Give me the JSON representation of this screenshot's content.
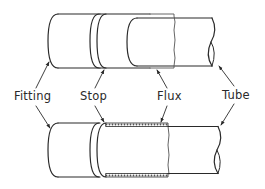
{
  "diagram": {
    "type": "technical-illustration",
    "stroke_color": "#2a2a2a",
    "background_color": "#ffffff",
    "labels": {
      "fitting": "Fitting",
      "stop": "Stop",
      "flux": "Flux",
      "tube": "Tube"
    },
    "views": [
      {
        "id": "top",
        "description": "Tube partially inserted into fitting, flux applied to tube end"
      },
      {
        "id": "bottom",
        "description": "Tube fully inserted up to the stop, flux visible at joint"
      }
    ]
  }
}
